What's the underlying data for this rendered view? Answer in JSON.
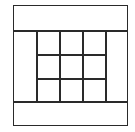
{
  "diagram": {
    "type": "grid-layout",
    "regions": [
      {
        "name": "top-band",
        "x": 13,
        "y": 5,
        "w": 115,
        "h": 25
      },
      {
        "name": "bottom-band",
        "x": 13,
        "y": 102,
        "w": 115,
        "h": 24
      },
      {
        "name": "left-column",
        "x": 13,
        "y": 30,
        "w": 23,
        "h": 72
      },
      {
        "name": "right-column",
        "x": 105,
        "y": 30,
        "w": 23,
        "h": 72
      },
      {
        "name": "center-grid",
        "x": 36,
        "y": 30,
        "w": 69,
        "h": 72,
        "rows": 3,
        "cols": 3
      }
    ],
    "colors": {
      "line": "#2a2a2a",
      "fill": "#ffffff"
    }
  }
}
